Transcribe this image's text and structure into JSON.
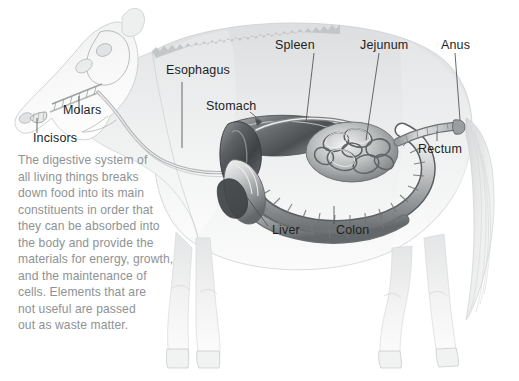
{
  "figure": {
    "background_color": "#ffffff",
    "label_color": "#221f1f",
    "body_text_color": "#8e9294",
    "illustration_tone": "grayscale pencil rendering"
  },
  "labels": [
    {
      "id": "molars",
      "text": "Molars",
      "x": 63,
      "y": 110
    },
    {
      "id": "incisors",
      "text": "Incisors",
      "x": 33,
      "y": 138
    },
    {
      "id": "esophagus",
      "text": "Esophagus",
      "x": 166,
      "y": 71
    },
    {
      "id": "stomach",
      "text": "Stomach",
      "x": 206,
      "y": 106
    },
    {
      "id": "spleen",
      "text": "Spleen",
      "x": 272,
      "y": 40
    },
    {
      "id": "jejunum",
      "text": "Jejunum",
      "x": 360,
      "y": 40
    },
    {
      "id": "anus",
      "text": "Anus",
      "x": 441,
      "y": 40
    },
    {
      "id": "rectum",
      "text": "Rectum",
      "x": 420,
      "y": 147
    },
    {
      "id": "liver",
      "text": "Liver",
      "x": 272,
      "y": 229
    },
    {
      "id": "colon",
      "text": "Colon",
      "x": 338,
      "y": 229
    }
  ],
  "body_text": {
    "lines": [
      "The digestive system of",
      "all living things breaks",
      "down food into its main",
      "constituents in order that",
      "they can be absorbed into",
      "the body and provide the",
      "materials for energy, growth,",
      "and the maintenance of",
      "cells. Elements that are",
      "not useful are passed",
      "out as waste matter."
    ]
  }
}
